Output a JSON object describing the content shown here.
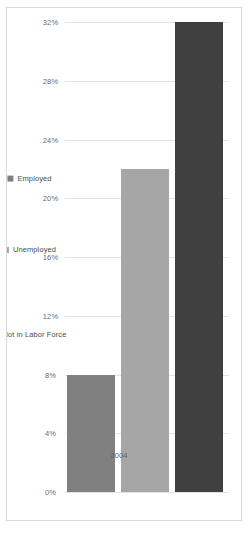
{
  "chart_data": {
    "type": "bar",
    "orientation": "horizontal",
    "title": "",
    "subtitle": "",
    "xlabel": "",
    "ylabel": "",
    "categories": [
      "2004"
    ],
    "category_axis_label": "2004",
    "series": [
      {
        "name": "Employed",
        "values": [
          8
        ],
        "color": "#808080"
      },
      {
        "name": "Unemployed",
        "values": [
          22
        ],
        "color": "#a6a6a6"
      },
      {
        "name": "Not in Labor Force",
        "values": [
          32
        ],
        "color": "#404040"
      }
    ],
    "value_axis": {
      "min": 0,
      "max": 32,
      "step": 4,
      "tick_labels": [
        "32%",
        "28%",
        "24%",
        "20%",
        "16%",
        "12%",
        "8%",
        "4%",
        "0%"
      ],
      "tick_values": [
        32,
        28,
        24,
        20,
        16,
        12,
        8,
        4,
        0
      ],
      "direction": "reversed",
      "format": "percent"
    },
    "grid": {
      "vertical": true,
      "horizontal": false,
      "color": "#e2e2e2"
    },
    "legend": {
      "position": "right",
      "entries": [
        {
          "label": "Employed",
          "color": "#808080"
        },
        {
          "label": "Unemployed",
          "color": "#a6a6a6"
        },
        {
          "label": "Not in Labor Force",
          "color": "#404040"
        }
      ]
    },
    "frame": {
      "border_color": "#d9d9d9",
      "background": "#ffffff"
    },
    "rotation_degrees": 90
  }
}
